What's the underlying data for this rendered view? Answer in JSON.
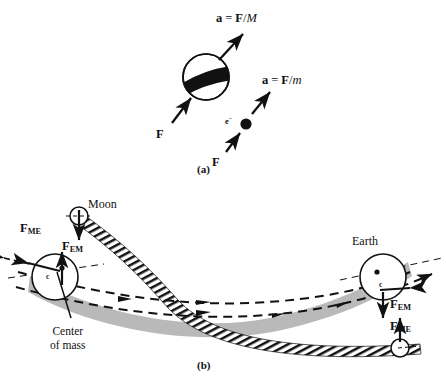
{
  "figure": {
    "panels": [
      {
        "id": "a",
        "caption": "(a)",
        "bodies": [
          {
            "name": "large-mass-sphere",
            "label": "",
            "force_label": "F",
            "accel_label": "a = F/M",
            "accel_parts": {
              "a": "a",
              "eq": "=",
              "F": "F",
              "slash": "/",
              "mass": "M"
            }
          },
          {
            "name": "electron",
            "label": "e",
            "label_charge": "−",
            "force_label": "F",
            "accel_label": "a = F/m",
            "accel_parts": {
              "a": "a",
              "eq": "=",
              "F": "F",
              "slash": "/",
              "mass": "m"
            }
          }
        ]
      },
      {
        "id": "b",
        "caption": "(b)",
        "bodies": [
          {
            "name": "moon",
            "label": "Moon"
          },
          {
            "name": "earth",
            "label": "Earth"
          }
        ],
        "annotations": [
          {
            "name": "center-of-mass-label",
            "line1": "Center",
            "line2": "of mass"
          },
          {
            "name": "com-marker-left",
            "label": "c"
          },
          {
            "name": "com-marker-right",
            "label": "c"
          }
        ],
        "forces": [
          {
            "name": "force-me-moon-left",
            "base": "F",
            "subscript": "ME"
          },
          {
            "name": "force-em-earth-left",
            "base": "F",
            "subscript": "EM"
          },
          {
            "name": "force-em-earth-right",
            "base": "F",
            "subscript": "EM"
          },
          {
            "name": "force-me-moon-right",
            "base": "F",
            "subscript": "ME"
          }
        ]
      }
    ]
  },
  "colors": {
    "ink": "#111111",
    "band_gray": "#b3b3b3",
    "background": "#ffffff"
  }
}
